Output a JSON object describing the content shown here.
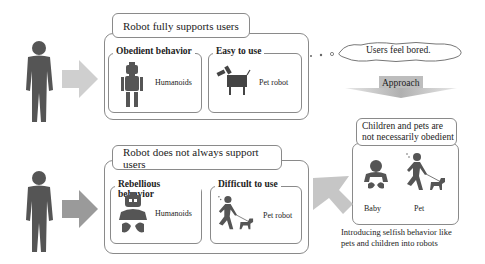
{
  "top_row": {
    "title": "Robot fully supports users",
    "panels": [
      {
        "title": "Obedient behavior",
        "icon": "humanoid-robot-icon",
        "label": "Humanoids"
      },
      {
        "title": "Easy to use",
        "icon": "pet-robot-icon",
        "label": "Pet robot"
      }
    ]
  },
  "bottom_row": {
    "title": "Robot does not always support users",
    "panels": [
      {
        "title": "Rebellious behavior",
        "icon": "baby-robot-icon",
        "label": "Humanoids"
      },
      {
        "title": "Difficult to use",
        "icon": "person-walking-dog-icon",
        "label": "Pet robot"
      }
    ]
  },
  "thought_bubble": {
    "text": "Users feel bored."
  },
  "approach_arrow": {
    "label": "Approach"
  },
  "right_box": {
    "title_line1": "Children and pets are",
    "title_line2": "not necessarily obedient",
    "items": [
      {
        "icon": "baby-icon",
        "label": "Baby"
      },
      {
        "icon": "person-walking-dog-icon",
        "label": "Pet"
      }
    ],
    "caption_line1": "Introducing selfish behavior like",
    "caption_line2": "pets and children into robots"
  },
  "colors": {
    "figure": "#555555",
    "arrow_light": "#c8c8c8",
    "arrow_dark": "#9a9a9a",
    "border": "#8a8a8a"
  }
}
